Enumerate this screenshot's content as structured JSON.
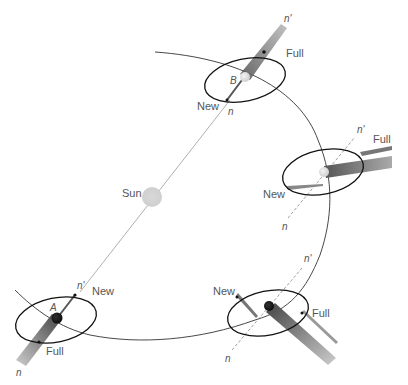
{
  "diagram": {
    "title": "",
    "sun": {
      "label": "Sun",
      "color": "#d6d6d6"
    },
    "positions": [
      {
        "id": "B",
        "label": "B",
        "new_label": "New",
        "full_label": "Full",
        "node_near": "n",
        "node_far": "n'"
      },
      {
        "id": "right",
        "label": "",
        "new_label": "New",
        "full_label": "Full",
        "node_near": "n",
        "node_far": "n'"
      },
      {
        "id": "bottom-right",
        "label": "",
        "new_label": "New",
        "full_label": "Full",
        "node_near": "n",
        "node_far": "n'"
      },
      {
        "id": "A",
        "label": "A",
        "new_label": "New",
        "full_label": "Full",
        "node_near": "n",
        "node_far": "n'"
      }
    ],
    "colors": {
      "orbit": "#333333",
      "line_of_nodes": "#999999",
      "shadow": "#8a8a8a",
      "earth_light": "#e6e6e6",
      "earth_dark": "#1a1a1a"
    }
  }
}
